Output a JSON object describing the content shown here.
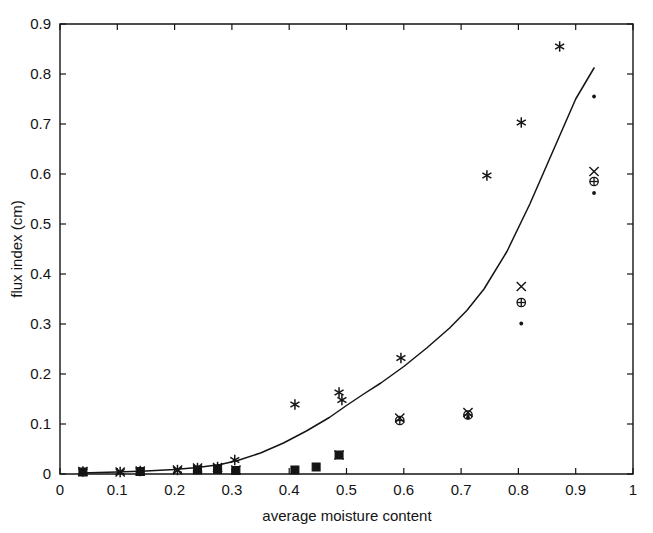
{
  "chart_data": {
    "type": "scatter",
    "title": "",
    "xlabel": "average moisture content",
    "ylabel": "flux index (cm)",
    "xlim": [
      0,
      1
    ],
    "ylim": [
      0,
      0.9
    ],
    "grid": false,
    "legend": "none",
    "xticks": [
      "0",
      "0.1",
      "0.2",
      "0.3",
      "0.4",
      "0.5",
      "0.6",
      "0.7",
      "0.8",
      "0.9",
      "1"
    ],
    "xtick_values": [
      0,
      0.1,
      0.2,
      0.3,
      0.4,
      0.5,
      0.6,
      0.7,
      0.8,
      0.9,
      1
    ],
    "yticks": [
      "0",
      "0.1",
      "0.2",
      "0.3",
      "0.4",
      "0.5",
      "0.6",
      "0.7",
      "0.8",
      "0.9"
    ],
    "ytick_values": [
      0,
      0.1,
      0.2,
      0.3,
      0.4,
      0.5,
      0.6,
      0.7,
      0.8,
      0.9
    ],
    "series": [
      {
        "name": "asterisk",
        "marker": "asterisk",
        "points": [
          [
            0.04,
            0.005
          ],
          [
            0.105,
            0.004
          ],
          [
            0.14,
            0.006
          ],
          [
            0.205,
            0.008
          ],
          [
            0.24,
            0.012
          ],
          [
            0.275,
            0.014
          ],
          [
            0.305,
            0.028
          ],
          [
            0.41,
            0.139
          ],
          [
            0.487,
            0.163
          ],
          [
            0.492,
            0.148
          ],
          [
            0.595,
            0.232
          ],
          [
            0.745,
            0.597
          ],
          [
            0.805,
            0.703
          ],
          [
            0.872,
            0.855
          ]
        ]
      },
      {
        "name": "cross",
        "marker": "x",
        "points": [
          [
            0.04,
            0.005
          ],
          [
            0.105,
            0.004
          ],
          [
            0.14,
            0.006
          ],
          [
            0.205,
            0.008
          ],
          [
            0.24,
            0.012
          ],
          [
            0.275,
            0.013
          ],
          [
            0.307,
            0.008
          ],
          [
            0.487,
            0.038
          ],
          [
            0.593,
            0.112
          ],
          [
            0.712,
            0.123
          ],
          [
            0.805,
            0.375
          ],
          [
            0.932,
            0.605
          ]
        ]
      },
      {
        "name": "circle-plus",
        "marker": "circle",
        "points": [
          [
            0.593,
            0.107
          ],
          [
            0.712,
            0.118
          ],
          [
            0.805,
            0.343
          ],
          [
            0.932,
            0.585
          ]
        ]
      },
      {
        "name": "square",
        "marker": "square",
        "points": [
          [
            0.04,
            0.004
          ],
          [
            0.14,
            0.005
          ],
          [
            0.24,
            0.008
          ],
          [
            0.275,
            0.009
          ],
          [
            0.307,
            0.007
          ],
          [
            0.41,
            0.008
          ],
          [
            0.447,
            0.014
          ],
          [
            0.487,
            0.038
          ]
        ]
      },
      {
        "name": "dot",
        "marker": "dot",
        "points": [
          [
            0.712,
            0.113
          ],
          [
            0.805,
            0.301
          ],
          [
            0.932,
            0.562
          ],
          [
            0.932,
            0.755
          ]
        ]
      }
    ],
    "fit_curve": {
      "name": "model fit",
      "style": "solid-line",
      "points": [
        [
          0.035,
          0.002
        ],
        [
          0.1,
          0.004
        ],
        [
          0.15,
          0.006
        ],
        [
          0.2,
          0.009
        ],
        [
          0.24,
          0.013
        ],
        [
          0.28,
          0.019
        ],
        [
          0.31,
          0.027
        ],
        [
          0.35,
          0.042
        ],
        [
          0.39,
          0.062
        ],
        [
          0.43,
          0.086
        ],
        [
          0.47,
          0.113
        ],
        [
          0.5,
          0.137
        ],
        [
          0.53,
          0.16
        ],
        [
          0.56,
          0.182
        ],
        [
          0.6,
          0.215
        ],
        [
          0.64,
          0.252
        ],
        [
          0.68,
          0.292
        ],
        [
          0.71,
          0.327
        ],
        [
          0.74,
          0.37
        ],
        [
          0.78,
          0.445
        ],
        [
          0.82,
          0.54
        ],
        [
          0.86,
          0.645
        ],
        [
          0.9,
          0.75
        ],
        [
          0.932,
          0.812
        ]
      ]
    }
  }
}
